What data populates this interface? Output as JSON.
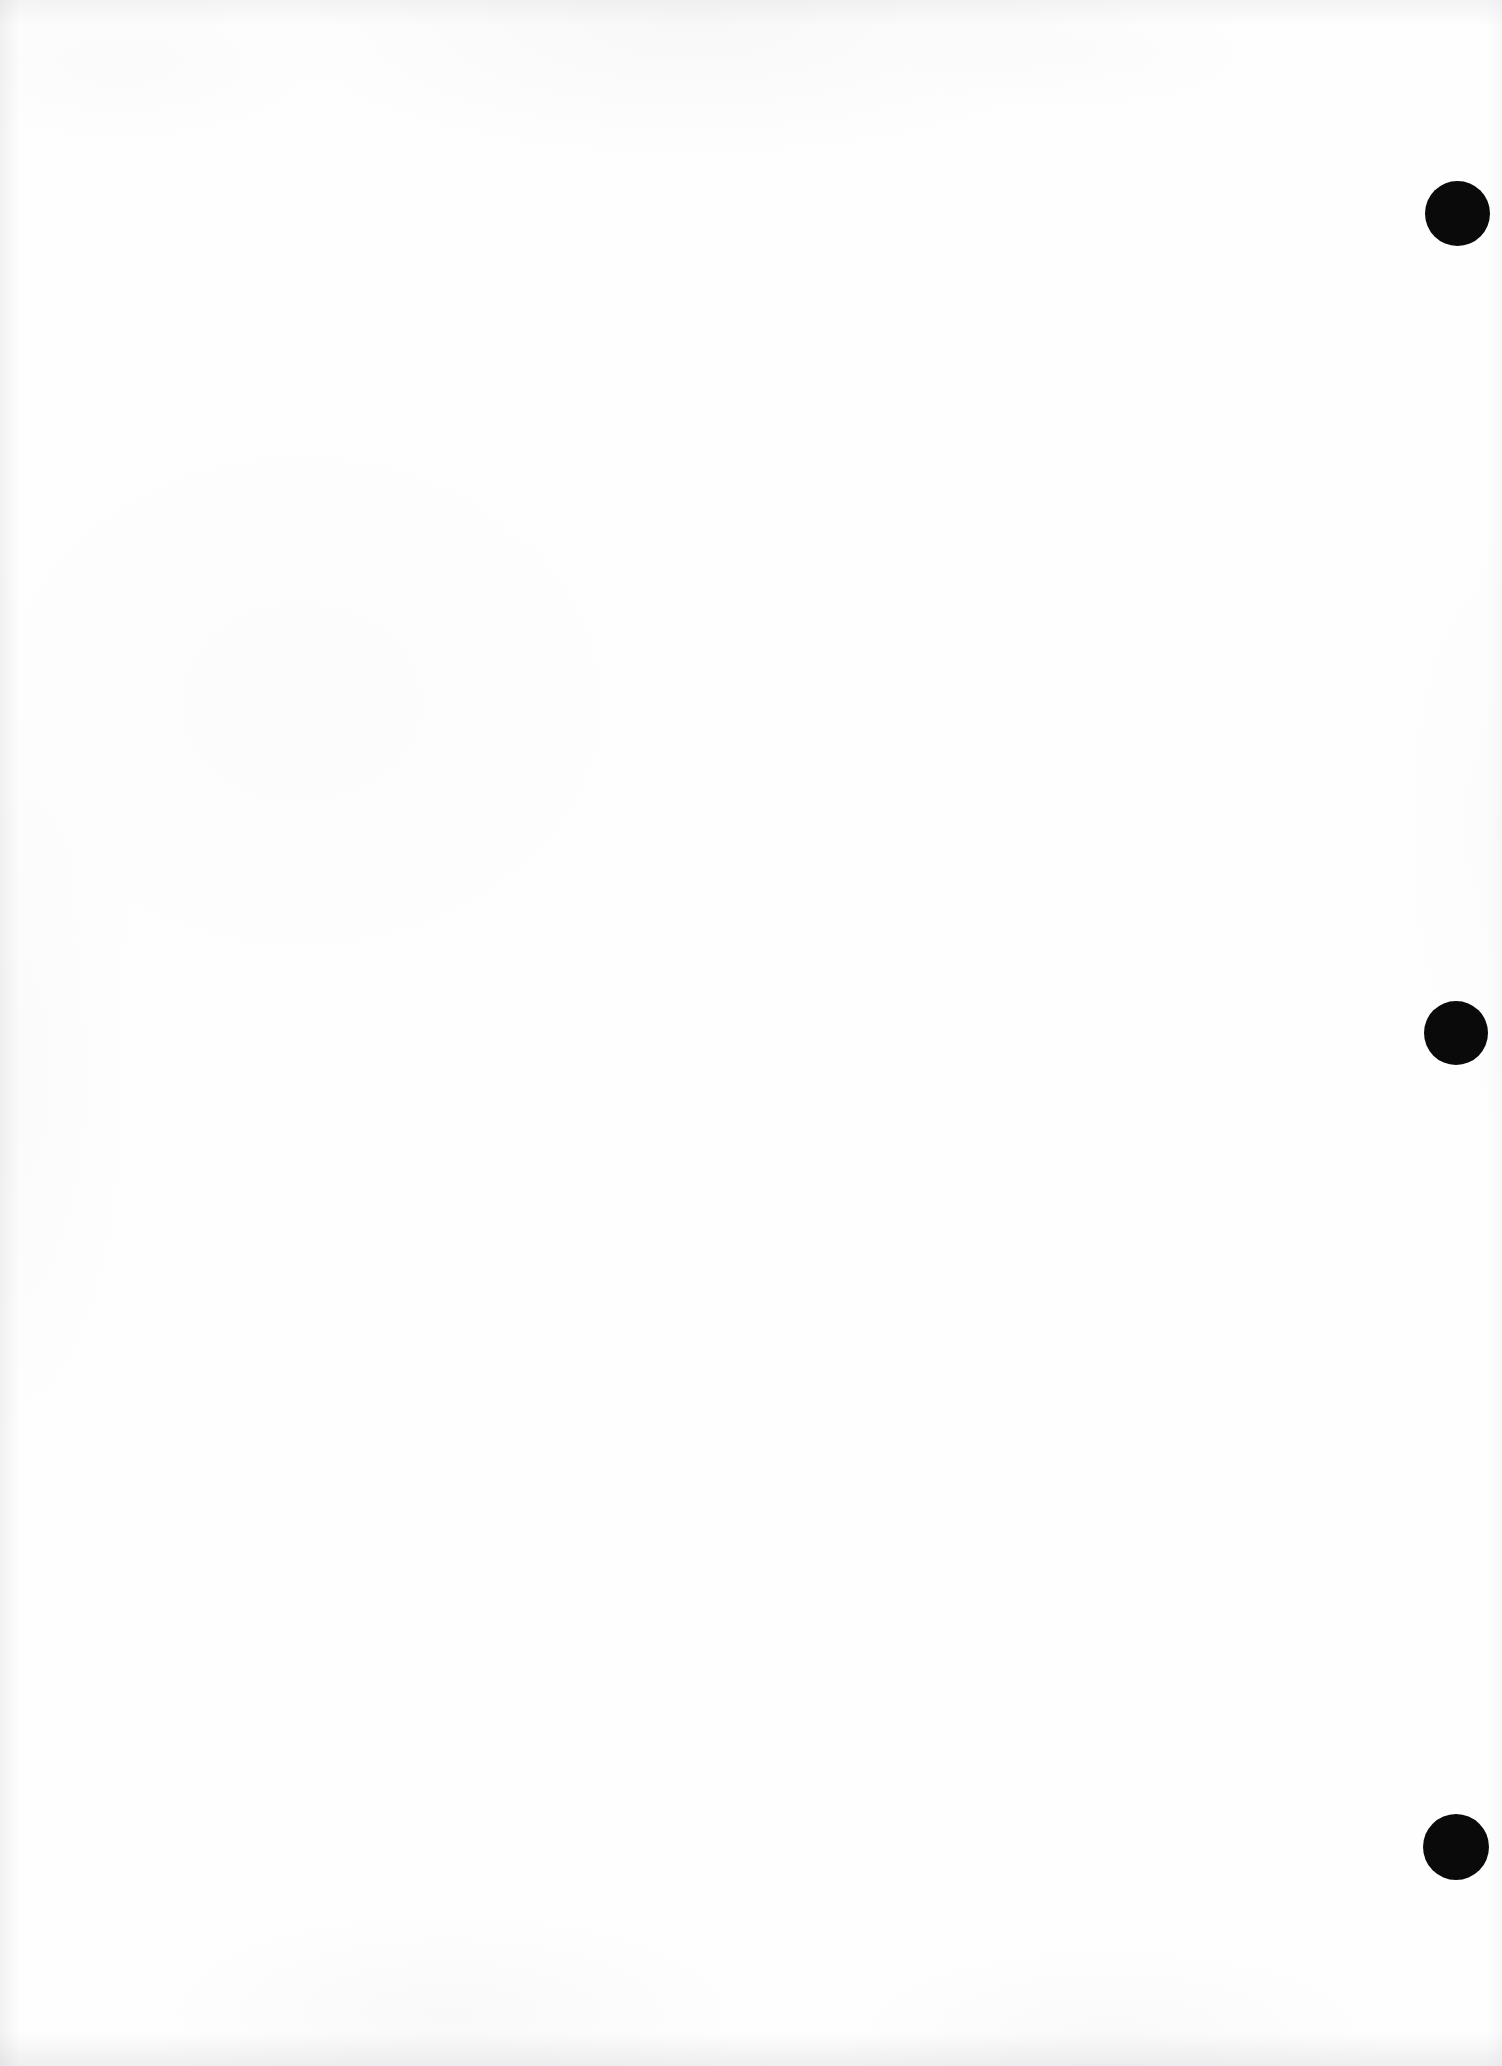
{
  "document": {
    "page_kind": "scanned-blank-page",
    "page_body_text": "",
    "page_number_text": "",
    "header_text": "",
    "footer_text": "",
    "background_color": "#fefefe",
    "paper_tone_color": "#ffffff",
    "ink_color": "#0a0a0a",
    "width_px": 1502,
    "height_px": 2066
  },
  "marks": {
    "label": "registration-dots",
    "color": "#0a0a0a",
    "count": 3,
    "items": [
      {
        "name": "registration-dot-top",
        "cx": 1457,
        "cy": 213,
        "d": 65
      },
      {
        "name": "registration-dot-middle",
        "cx": 1456,
        "cy": 1033,
        "d": 64
      },
      {
        "name": "registration-dot-bottom",
        "cx": 1456,
        "cy": 1847,
        "d": 66
      }
    ]
  },
  "scan_artifacts": {
    "top_edge_shadow": true,
    "bottom_edge_shadow": true,
    "left_edge_shadow": true,
    "right_edge_shadow": true
  }
}
